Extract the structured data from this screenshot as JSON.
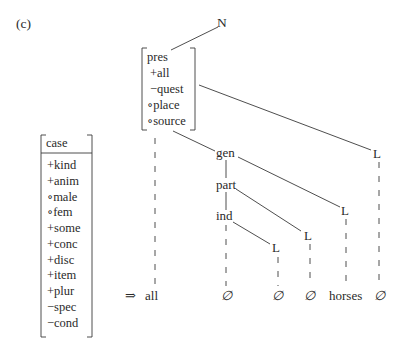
{
  "figure": {
    "panel_label": "(c)",
    "root": "N",
    "top_matrix": {
      "features": [
        "pres",
        "+all",
        "−quest",
        "∘place",
        "∘source"
      ]
    },
    "left_matrix": {
      "header": "case",
      "features": [
        "+kind",
        "+anim",
        "∘male",
        "∘fem",
        "+some",
        "+conc",
        "+disc",
        "+item",
        "+plur",
        "−spec",
        "−cond"
      ]
    },
    "nodes": {
      "gen": "gen",
      "part": "part",
      "ind": "ind",
      "L_right": "L",
      "L_gen": "L",
      "L_part": "L",
      "L_ind": "L"
    },
    "output": {
      "arrow": "⇒",
      "items": [
        "all",
        "∅",
        "∅",
        "∅",
        "horses",
        "∅"
      ]
    }
  }
}
